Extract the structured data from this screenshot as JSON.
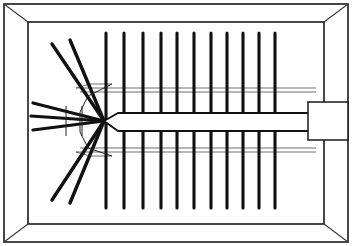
{
  "figure": {
    "domain": "technical line drawing",
    "background_color": "#ffffff",
    "ink_color": "#111111",
    "width": 352,
    "height": 246
  },
  "frame": {
    "name": "outer rectangular frame",
    "outer": {
      "x": 4,
      "y": 4,
      "width": 344,
      "height": 238
    },
    "inner": {
      "x": 28,
      "y": 22,
      "width": 296,
      "height": 202
    },
    "bevel_corners": [
      {
        "name": "top-left",
        "from_x": 4,
        "from_y": 4,
        "to_x": 28,
        "to_y": 22
      },
      {
        "name": "top-right",
        "from_x": 348,
        "from_y": 4,
        "to_x": 324,
        "to_y": 22
      },
      {
        "name": "bottom-left",
        "from_x": 4,
        "from_y": 242,
        "to_x": 28,
        "to_y": 224
      },
      {
        "name": "bottom-right",
        "from_x": 348,
        "from_y": 242,
        "to_x": 324,
        "to_y": 224
      }
    ],
    "stroke_color": "#1a1a1a"
  },
  "center_bar": {
    "name": "central tapered spine bar",
    "tip_x": 104,
    "tip_y": 121,
    "right_x": 318,
    "top_y": 113,
    "bottom_y": 131,
    "fill": "#ffffff",
    "stroke": "#111111"
  },
  "connector": {
    "name": "right edge connector block",
    "x": 308,
    "y": 102,
    "width": 40,
    "height": 38,
    "fill": "#ffffff",
    "stroke": "#1a1a1a"
  },
  "vertical_rods": {
    "name": "vertical cross rods",
    "count": 11,
    "top_y": 33,
    "bottom_y": 208,
    "stroke_width": 3.1,
    "x_positions": [
      106,
      124,
      143,
      161,
      177,
      194,
      211,
      227,
      243,
      259,
      275
    ]
  },
  "fan_rods": {
    "name": "left fan of diagonal rods",
    "hub_x": 104,
    "hub_y": 121,
    "count": 7,
    "rods": [
      {
        "id": "upper-steep-outer",
        "end_x": 52,
        "end_y": 44
      },
      {
        "id": "upper-steep-inner",
        "end_x": 70,
        "end_y": 40
      },
      {
        "id": "upper-shallow",
        "end_x": 33,
        "end_y": 103
      },
      {
        "id": "middle-horizontal",
        "end_x": 31,
        "end_y": 116
      },
      {
        "id": "lower-shallow",
        "end_x": 33,
        "end_y": 130
      },
      {
        "id": "lower-steep-inner",
        "end_x": 70,
        "end_y": 203
      },
      {
        "id": "lower-steep-outer",
        "end_x": 52,
        "end_y": 200
      }
    ]
  },
  "guide_lines": {
    "name": "thin horizontal guide lines",
    "upper": [
      {
        "y": 88,
        "x1": 76,
        "x2": 316
      },
      {
        "y": 92,
        "x1": 80,
        "x2": 316
      }
    ],
    "lower": [
      {
        "y": 148,
        "x1": 80,
        "x2": 316
      },
      {
        "y": 152,
        "x1": 76,
        "x2": 316
      }
    ],
    "stroke": "#555555"
  },
  "hub_detail": {
    "name": "hub collar outline",
    "x": 66,
    "y": 106,
    "width": 16,
    "height": 30
  }
}
